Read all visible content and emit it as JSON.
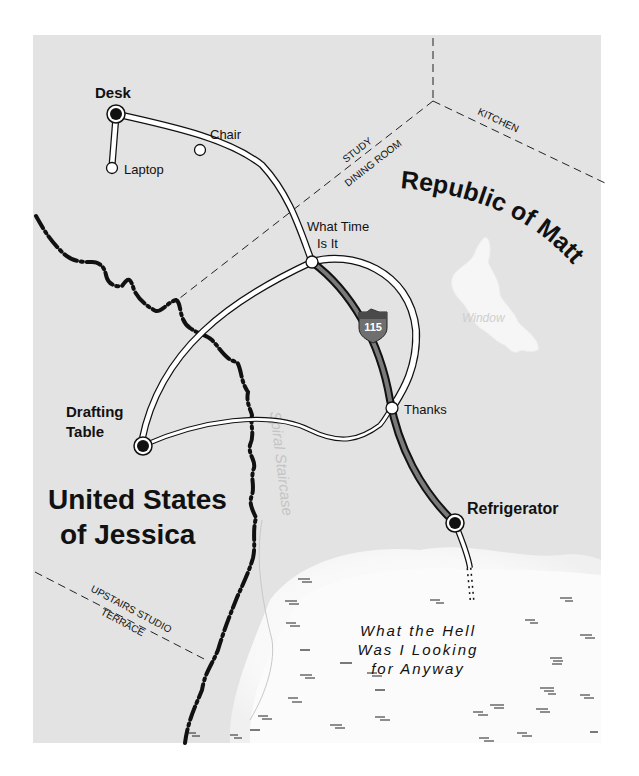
{
  "map": {
    "background_color": "#e3e3e3",
    "swamp_color": "#fafafa",
    "window_lake_color": "#f6f6f6",
    "highway_color": "#7a7a7a"
  },
  "countries": {
    "republic": "Republic of Matt",
    "states_line1": "United States",
    "states_line2": "of Jessica"
  },
  "regions": {
    "study": "STUDY",
    "dining_room": "DINING ROOM",
    "kitchen": "KITCHEN",
    "upstairs_studio": "UPSTAIRS STUDIO",
    "terrace": "TERRACE"
  },
  "features": {
    "window": "Window",
    "spiral_staircase": "Spiral Staircase",
    "swamp_line1": "What the Hell",
    "swamp_line2": "Was I Looking",
    "swamp_line3": "for Anyway"
  },
  "cities": {
    "desk": "Desk",
    "chair": "Chair",
    "laptop": "Laptop",
    "what_time_line1": "What Time",
    "what_time_line2": "Is It",
    "drafting_line1": "Drafting",
    "drafting_line2": "Table",
    "thanks": "Thanks",
    "refrigerator": "Refrigerator"
  },
  "highway": {
    "shield_number": "115"
  }
}
